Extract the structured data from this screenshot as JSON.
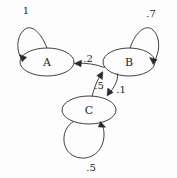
{
  "diagram": {
    "kind": "markov-chain-state-diagram",
    "background_color": "#fdfdfd",
    "stroke_color": "#2b2b2b",
    "text_color": "#1f1f1f",
    "states": [
      {
        "id": "A",
        "label": "A",
        "cx": 47,
        "cy": 62,
        "rx": 27,
        "ry": 14
      },
      {
        "id": "B",
        "label": "B",
        "cx": 129,
        "cy": 62,
        "rx": 26,
        "ry": 14
      },
      {
        "id": "C",
        "label": "C",
        "cx": 89,
        "cy": 110,
        "rx": 27,
        "ry": 14
      }
    ],
    "transitions": [
      {
        "id": "a-self",
        "from": "A",
        "to": "A",
        "label": "1",
        "label_x": 26,
        "label_y": 11
      },
      {
        "id": "b-self",
        "from": "B",
        "to": "B",
        "label": ".7",
        "label_x": 151,
        "label_y": 14
      },
      {
        "id": "b-to-a",
        "from": "B",
        "to": "A",
        "label": ".2",
        "label_x": 88,
        "label_y": 59
      },
      {
        "id": "c-to-b",
        "from": "C",
        "to": "B",
        "label": ".5",
        "label_x": 99,
        "label_y": 86
      },
      {
        "id": "b-to-c",
        "from": "B",
        "to": "C",
        "label": ".1",
        "label_x": 121,
        "label_y": 90
      },
      {
        "id": "c-self",
        "from": "C",
        "to": "C",
        "label": ".5",
        "label_x": 91,
        "label_y": 168
      }
    ]
  }
}
